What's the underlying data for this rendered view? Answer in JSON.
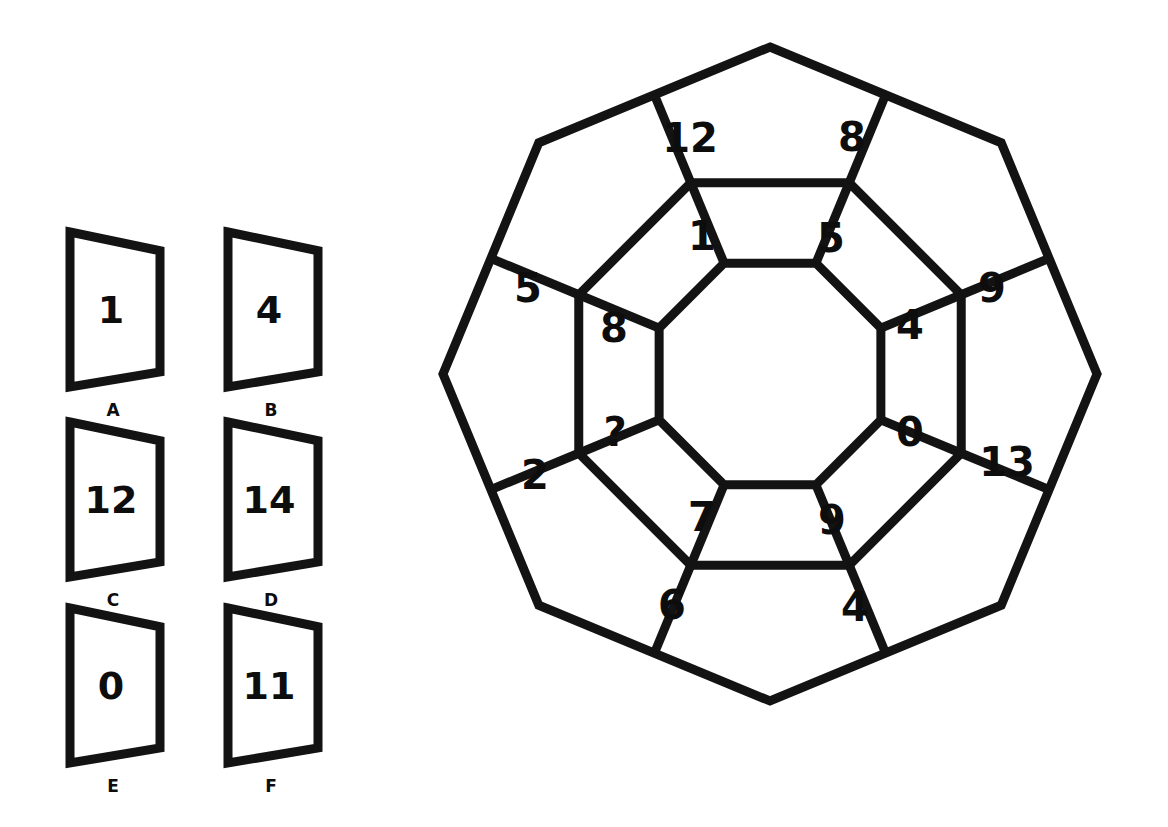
{
  "puzzle": {
    "title": "Octagon ring number puzzle",
    "missing_marker": "?",
    "geometry": {
      "outer_center_x": 770,
      "outer_center_y": 374,
      "outer_radius": 327,
      "middle_radius": 207,
      "inner_radius": 120,
      "sides": 8
    },
    "outer_ring": {
      "description": "Eight trapezoid cells around the rim of the octagon",
      "cells": [
        {
          "id": "outer-top-left",
          "value": "12",
          "x": 690,
          "y": 138
        },
        {
          "id": "outer-top-right",
          "value": "8",
          "x": 852,
          "y": 137
        },
        {
          "id": "outer-right-upper",
          "value": "9",
          "x": 992,
          "y": 288
        },
        {
          "id": "outer-right-lower",
          "value": "13",
          "x": 1007,
          "y": 462
        },
        {
          "id": "outer-bottom-right",
          "value": "4",
          "x": 855,
          "y": 607
        },
        {
          "id": "outer-bottom-left",
          "value": "6",
          "x": 672,
          "y": 605
        },
        {
          "id": "outer-left-lower",
          "value": "2",
          "x": 535,
          "y": 475
        },
        {
          "id": "outer-left-upper",
          "value": "5",
          "x": 528,
          "y": 288
        }
      ]
    },
    "inner_ring": {
      "description": "Eight trapezoid cells forming the inner ring around the central hole",
      "cells": [
        {
          "id": "inner-top-left",
          "value": "1",
          "x": 702,
          "y": 236
        },
        {
          "id": "inner-top-right",
          "value": "5",
          "x": 831,
          "y": 238
        },
        {
          "id": "inner-right-upper",
          "value": "4",
          "x": 910,
          "y": 325
        },
        {
          "id": "inner-right-lower",
          "value": "0",
          "x": 910,
          "y": 432
        },
        {
          "id": "inner-bottom-right",
          "value": "9",
          "x": 832,
          "y": 520
        },
        {
          "id": "inner-bottom-left",
          "value": "7",
          "x": 702,
          "y": 517
        },
        {
          "id": "inner-left-lower",
          "value": "?",
          "x": 615,
          "y": 432
        },
        {
          "id": "inner-left-upper",
          "value": "8",
          "x": 614,
          "y": 328
        }
      ]
    }
  },
  "options": {
    "description": "Six answer tiles labelled A to F",
    "items": [
      {
        "letter": "A",
        "value": "1",
        "x": 70,
        "y": 232
      },
      {
        "letter": "B",
        "value": "4",
        "x": 228,
        "y": 232
      },
      {
        "letter": "C",
        "value": "12",
        "x": 70,
        "y": 422
      },
      {
        "letter": "D",
        "value": "14",
        "x": 228,
        "y": 422
      },
      {
        "letter": "E",
        "value": "0",
        "x": 70,
        "y": 608
      },
      {
        "letter": "F",
        "value": "11",
        "x": 228,
        "y": 608
      }
    ]
  },
  "colors": {
    "ink": "#131313",
    "background": "#ffffff"
  }
}
